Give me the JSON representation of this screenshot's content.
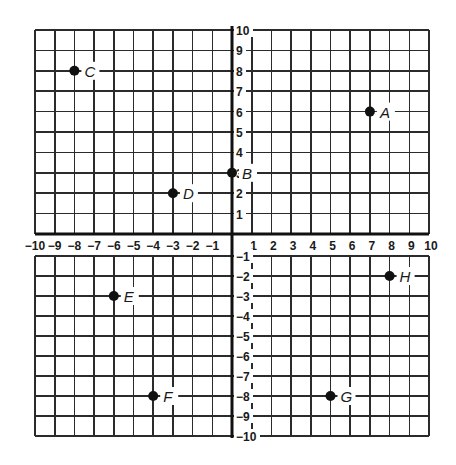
{
  "chart_data": {
    "type": "scatter",
    "title": "",
    "xlabel": "",
    "ylabel": "",
    "xlim": [
      -10,
      10
    ],
    "ylim": [
      -10,
      10
    ],
    "grid": true,
    "x_ticks": [
      "-10",
      "-9",
      "-8",
      "-7",
      "-6",
      "-5",
      "-4",
      "-3",
      "-2",
      "-1",
      "1",
      "2",
      "3",
      "4",
      "5",
      "6",
      "7",
      "8",
      "9",
      "10"
    ],
    "y_ticks": [
      "10",
      "9",
      "8",
      "7",
      "6",
      "5",
      "4",
      "3",
      "2",
      "1",
      "-1",
      "-2",
      "-3",
      "-4",
      "-5",
      "-6",
      "-7",
      "-8",
      "-9",
      "-10"
    ],
    "points": [
      {
        "label": "A",
        "x": 7,
        "y": 6
      },
      {
        "label": "B",
        "x": 0,
        "y": 3
      },
      {
        "label": "C",
        "x": -8,
        "y": 8
      },
      {
        "label": "D",
        "x": -3,
        "y": 2
      },
      {
        "label": "E",
        "x": -6,
        "y": -3
      },
      {
        "label": "F",
        "x": -4,
        "y": -8
      },
      {
        "label": "G",
        "x": 5,
        "y": -8
      },
      {
        "label": "H",
        "x": 8,
        "y": -2
      }
    ]
  },
  "colors": {
    "grid": "#2b2b2b",
    "axis": "#111111",
    "point": "#111111",
    "background": "#ffffff"
  }
}
